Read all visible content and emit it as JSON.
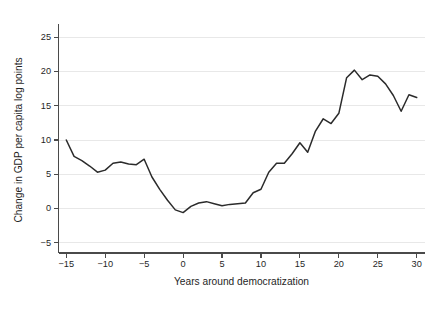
{
  "chart_data": {
    "type": "line",
    "title": "",
    "subtitle": "",
    "xlabel": "Years around democratization",
    "ylabel": "Change in GDP per capita log points",
    "xlim": [
      -16,
      31
    ],
    "ylim": [
      -6.5,
      26.5
    ],
    "xticks": [
      -15,
      -10,
      -5,
      0,
      5,
      10,
      15,
      20,
      25,
      30
    ],
    "xtick_labels": [
      "−15",
      "−10",
      "−5",
      "0",
      "5",
      "10",
      "15",
      "20",
      "25",
      "30"
    ],
    "yticks": [
      -5,
      0,
      5,
      10,
      15,
      20,
      25
    ],
    "ytick_labels": [
      "−5",
      "0",
      "5",
      "10",
      "15",
      "20",
      "25"
    ],
    "grid": "horizontal",
    "legend": "none",
    "line_color": "#2b2b2b",
    "grid_color": "#e8e8e8",
    "axis_color": "#4a4a4a",
    "series": [
      {
        "name": "Change in GDP per capita log points",
        "x": [
          -15,
          -14,
          -13,
          -12,
          -11,
          -10,
          -9,
          -8,
          -7,
          -6,
          -5,
          -4,
          -3,
          -2,
          -1,
          0,
          1,
          2,
          3,
          4,
          5,
          6,
          7,
          8,
          9,
          10,
          11,
          12,
          13,
          14,
          15,
          16,
          17,
          18,
          19,
          20,
          21,
          22,
          23,
          24,
          25,
          26,
          27,
          28,
          29,
          30
        ],
        "values": [
          10.0,
          7.6,
          7.0,
          6.2,
          5.3,
          5.6,
          6.6,
          6.8,
          6.5,
          6.4,
          7.2,
          4.6,
          2.8,
          1.2,
          -0.2,
          -0.6,
          0.3,
          0.8,
          1.0,
          0.7,
          0.4,
          0.6,
          0.7,
          0.8,
          2.3,
          2.8,
          5.3,
          6.6,
          6.6,
          8.0,
          9.6,
          8.2,
          11.3,
          13.1,
          12.4,
          13.9,
          19.1,
          20.2,
          18.8,
          19.5,
          19.3,
          18.2,
          16.5,
          14.2,
          16.6,
          16.2
        ]
      }
    ]
  },
  "figure": {
    "background_color": "#ffffff",
    "ylabel_text": "Change in GDP per capita log points",
    "xlabel_text": "Years around democratization"
  }
}
